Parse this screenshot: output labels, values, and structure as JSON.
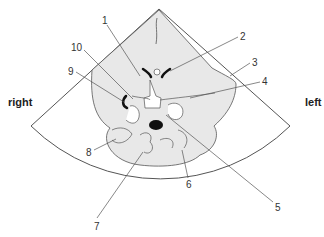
{
  "diagram": {
    "type": "ultrasound-brain-cross-section",
    "orientation": {
      "left_side_label": "right",
      "right_side_label": "left"
    },
    "labels": [
      {
        "id": "1",
        "text": "1",
        "x": 102,
        "y": 16
      },
      {
        "id": "2",
        "text": "2",
        "x": 240,
        "y": 32
      },
      {
        "id": "3",
        "text": "3",
        "x": 252,
        "y": 58
      },
      {
        "id": "4",
        "text": "4",
        "x": 262,
        "y": 77
      },
      {
        "id": "5",
        "text": "5",
        "x": 275,
        "y": 203
      },
      {
        "id": "6",
        "text": "6",
        "x": 186,
        "y": 180
      },
      {
        "id": "7",
        "text": "7",
        "x": 94,
        "y": 222
      },
      {
        "id": "8",
        "text": "8",
        "x": 86,
        "y": 148
      },
      {
        "id": "9",
        "text": "9",
        "x": 68,
        "y": 67
      },
      {
        "id": "10",
        "text": "10",
        "x": 71,
        "y": 43
      }
    ],
    "colors": {
      "line": "#555555",
      "tissue": "#e8e8e8",
      "dark": "#111111",
      "text": "#333333"
    }
  }
}
